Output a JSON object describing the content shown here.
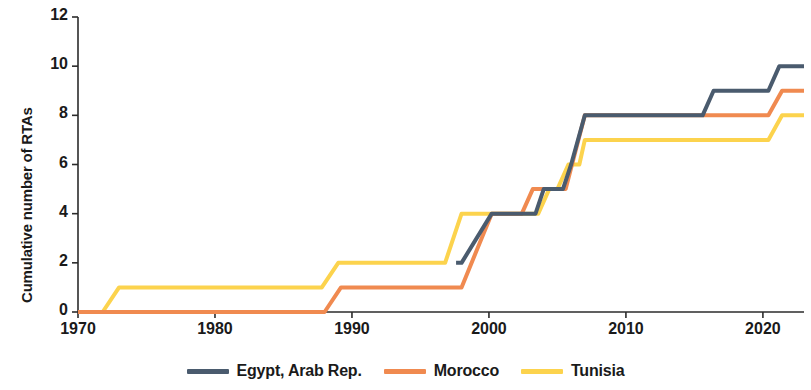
{
  "chart_data": {
    "type": "line",
    "title": "",
    "xlabel": "",
    "ylabel": "Cumulative number of RTAs",
    "xlim": [
      1970,
      2023
    ],
    "ylim": [
      0,
      12
    ],
    "xticks": [
      1970,
      1980,
      1990,
      2000,
      2010,
      2020
    ],
    "yticks": [
      0,
      2,
      4,
      6,
      8,
      10,
      12
    ],
    "grid": false,
    "legend_position": "bottom",
    "step_style": "post-linear-ramp",
    "series": [
      {
        "name": "Egypt, Arab Rep.",
        "color": "#4a5b6e",
        "x": [
          1997.6,
          1998.0,
          2000.2,
          2003.4,
          2004.0,
          2005.0,
          2005.4,
          2006.0,
          2007.0,
          2015.6,
          2016.4,
          2020.4,
          2021.2,
          2023.0
        ],
        "y": [
          2,
          2,
          4,
          4,
          5,
          5,
          5,
          6,
          8,
          8,
          9,
          9,
          10,
          10
        ]
      },
      {
        "name": "Morocco",
        "color": "#f08a50",
        "x": [
          1970,
          1988.0,
          1989.2,
          1997.0,
          1998.0,
          2000.2,
          2002.4,
          2003.2,
          2005.6,
          2007.0,
          2020.4,
          2021.4,
          2023.0
        ],
        "y": [
          0,
          0,
          1,
          1,
          1,
          4,
          4,
          5,
          5,
          8,
          8,
          9,
          9
        ]
      },
      {
        "name": "Tunisia",
        "color": "#fcd34d",
        "x": [
          1970,
          1971.8,
          1973.0,
          1987.8,
          1989.0,
          1996.8,
          1998.0,
          2003.6,
          2004.4,
          2005.0,
          2005.8,
          2006.6,
          2007.0,
          2020.4,
          2021.4,
          2023.0
        ],
        "y": [
          0,
          0,
          1,
          1,
          2,
          2,
          4,
          4,
          5,
          5,
          6,
          6,
          7,
          7,
          8,
          8
        ]
      }
    ],
    "legend": [
      {
        "label": "Egypt, Arab Rep.",
        "color": "#4a5b6e"
      },
      {
        "label": "Morocco",
        "color": "#f08a50"
      },
      {
        "label": "Tunisia",
        "color": "#fcd34d"
      }
    ]
  },
  "axis": {
    "y_title": "Cumulative number of RTAs",
    "y_tick_labels": [
      "0",
      "2",
      "4",
      "6",
      "8",
      "10",
      "12"
    ],
    "x_tick_labels": [
      "1970",
      "1980",
      "1990",
      "2000",
      "2010",
      "2020"
    ]
  },
  "colors": {
    "axis": "#2b2b2b",
    "egypt": "#4a5b6e",
    "morocco": "#f08a50",
    "tunisia": "#fcd34d",
    "background": "#ffffff"
  }
}
